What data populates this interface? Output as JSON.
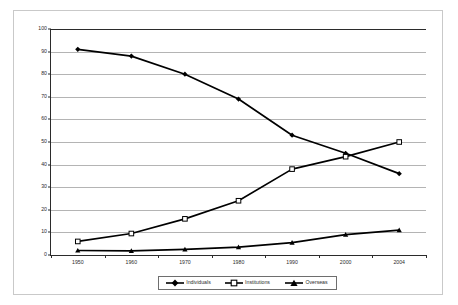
{
  "chart_data": {
    "type": "line",
    "title": "",
    "subtitle": "",
    "xlabel": "",
    "ylabel": "",
    "x": [
      "1950",
      "1960",
      "1970",
      "1980",
      "1990",
      "2000",
      "2004"
    ],
    "categories": [
      "1950",
      "1960",
      "1970",
      "1980",
      "1990",
      "2000",
      "2004"
    ],
    "series": [
      {
        "name": "Individuals",
        "marker": "filled-diamond",
        "color": "#000000",
        "values": [
          91,
          88,
          80,
          69,
          53,
          45,
          36
        ]
      },
      {
        "name": "Institutions",
        "marker": "open-square",
        "color": "#000000",
        "values": [
          6,
          9.5,
          16,
          24,
          38,
          43.5,
          50
        ]
      },
      {
        "name": "Overseas",
        "marker": "filled-triangle",
        "color": "#000000",
        "values": [
          2,
          1.8,
          2.5,
          3.5,
          5.5,
          9,
          11
        ]
      }
    ],
    "ylim": [
      0,
      100
    ],
    "ytick_values": [
      0,
      10,
      20,
      30,
      40,
      50,
      60,
      70,
      80,
      90,
      100
    ],
    "ytick_labels": [
      "0",
      "10",
      "20",
      "30",
      "40",
      "50",
      "60",
      "70",
      "80",
      "90",
      "100"
    ],
    "xtick_labels": [
      "1950",
      "1960",
      "1970",
      "1980",
      "1990",
      "2000",
      "2004"
    ],
    "grid": "horizontal",
    "legend_position": "bottom",
    "legend_entries": [
      "Individuals",
      "Institutions",
      "Overseas"
    ],
    "colors": {
      "axis": "#2b2b2b",
      "gridline": "#b4b4b4",
      "plot_background": "#ffffff",
      "frame_border": "#c9c9c9",
      "legend_border": "#6e6e6e",
      "series": "#000000"
    }
  }
}
